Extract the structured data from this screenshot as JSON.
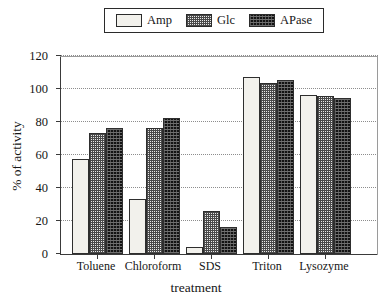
{
  "chart_data": {
    "type": "bar",
    "title": "",
    "xlabel": "treatment",
    "ylabel": "% of activity",
    "categories": [
      "Toluene",
      "Chloroform",
      "SDS",
      "Triton",
      "Lysozyme"
    ],
    "series": [
      {
        "name": "Amp",
        "values": [
          57,
          33,
          4,
          107,
          96
        ]
      },
      {
        "name": "Glc",
        "values": [
          73,
          76,
          26,
          103,
          95
        ]
      },
      {
        "name": "APase",
        "values": [
          76,
          82,
          16,
          105,
          94
        ]
      }
    ],
    "ylim": [
      0,
      120
    ],
    "yticks": [
      0,
      20,
      40,
      60,
      80,
      100,
      120
    ],
    "ytick_labels": [
      "0",
      "20",
      "40",
      "60",
      "80",
      "100",
      "120"
    ],
    "grid": true,
    "grid_style": "dotted",
    "legend_position": "top-center",
    "series_fill": {
      "Amp": "#f2f1ec",
      "Glc": "#b4b4b4",
      "APase": "#131313"
    }
  },
  "legend": {
    "entries": [
      {
        "label": "Amp",
        "swatch": "legend-swatch-amp"
      },
      {
        "label": "Glc",
        "swatch": "legend-swatch-glc"
      },
      {
        "label": "APase",
        "swatch": "legend-swatch-apase"
      }
    ]
  }
}
